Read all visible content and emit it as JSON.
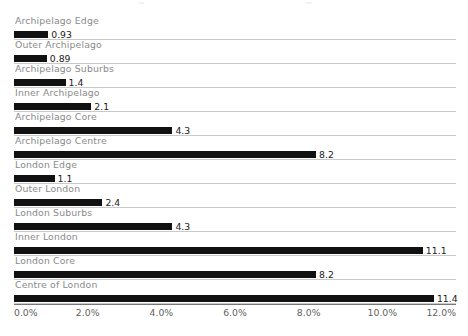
{
  "chart_data": {
    "type": "bar",
    "orientation": "horizontal",
    "title": "",
    "xlabel": "",
    "ylabel": "",
    "xlim": [
      0.0,
      12.0
    ],
    "tick_suffix": "%",
    "grid": true,
    "legend": false,
    "x_tick_labels": [
      "0.0%",
      "2.0%",
      "4.0%",
      "6.0%",
      "8.0%",
      "10.0%",
      "12.0%"
    ],
    "x_tick_values": [
      0.0,
      2.0,
      4.0,
      6.0,
      8.0,
      10.0,
      12.0
    ],
    "categories": [
      "Archipelago Edge",
      "Outer Archipelago",
      "Archipelago Suburbs",
      "Inner Archipelago",
      "Archipelago Core",
      "Archipelago Centre",
      "London Edge",
      "Outer London",
      "London Suburbs",
      "Inner London",
      "London Core",
      "Centre of London"
    ],
    "values": [
      0.93,
      0.89,
      1.4,
      2.1,
      4.3,
      8.2,
      1.1,
      2.4,
      4.3,
      11.1,
      8.2,
      11.4
    ],
    "value_labels": [
      "0.93",
      "0.89",
      "1.4",
      "2.1",
      "4.3",
      "8.2",
      "1.1",
      "2.4",
      "4.3",
      "11.1",
      "8.2",
      "11.4"
    ],
    "colors": {
      "bar": "#111111",
      "category_label": "#8a8a8a",
      "value_label": "#1a1a1a",
      "gridline": "#c9c9c9",
      "axis_line": "#777777",
      "tick_label": "#5f5f5f",
      "background": "#ffffff"
    }
  }
}
